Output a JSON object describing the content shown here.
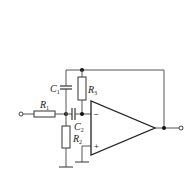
{
  "diagram": {
    "type": "op-amp circuit (multiple-feedback filter)",
    "components": {
      "R1": {
        "letter": "R",
        "sub": "1"
      },
      "R2": {
        "letter": "R",
        "sub": "2"
      },
      "R3": {
        "letter": "R",
        "sub": "3"
      },
      "C1": {
        "letter": "C",
        "sub": "1"
      },
      "C2": {
        "letter": "C",
        "sub": "2"
      }
    },
    "opamp": {
      "inverting_label": "−",
      "noninverting_label": "+"
    },
    "colors": {
      "wire": "#555555",
      "component": "#333333",
      "background": "#ffffff"
    }
  }
}
